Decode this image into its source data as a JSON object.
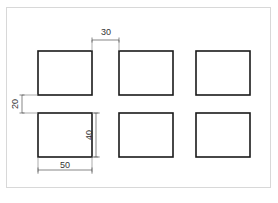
{
  "document": {
    "type": "engineering-drawing",
    "caption": ""
  },
  "frame": {
    "border_color": "#d8d8d8"
  },
  "style": {
    "line_color": "#1a1a1a",
    "dimension_line_color": "#555555",
    "extension_line_color": "#888888",
    "text_color": "#333333",
    "background": "#ffffff",
    "rect_stroke_width": 1.6,
    "dim_stroke_width": 0.7
  },
  "chart_data": {
    "type": "diagram",
    "title": "",
    "subtitle": "",
    "units": "mm",
    "grid": {
      "rows": 2,
      "columns": 3,
      "count": 6
    },
    "feature": {
      "shape": "rectangle",
      "width": 50,
      "height": 40
    },
    "spacing": {
      "column_gap": 30,
      "row_gap": 20,
      "column_pitch": 80,
      "row_pitch": 60
    },
    "rectangles": [
      {
        "id": "r1c1",
        "row": 1,
        "col": 1,
        "x": 38,
        "y": 51,
        "w": 54,
        "h": 44
      },
      {
        "id": "r1c2",
        "row": 1,
        "col": 2,
        "x": 119,
        "y": 51,
        "w": 54,
        "h": 44
      },
      {
        "id": "r1c3",
        "row": 1,
        "col": 3,
        "x": 196,
        "y": 51,
        "w": 54,
        "h": 44
      },
      {
        "id": "r2c1",
        "row": 2,
        "col": 1,
        "x": 38,
        "y": 113,
        "w": 54,
        "h": 44
      },
      {
        "id": "r2c2",
        "row": 2,
        "col": 2,
        "x": 119,
        "y": 113,
        "w": 54,
        "h": 44
      },
      {
        "id": "r2c3",
        "row": 2,
        "col": 3,
        "x": 196,
        "y": 113,
        "w": 54,
        "h": 44
      }
    ],
    "dimensions": [
      {
        "id": "dim-30",
        "label": "30",
        "value": 30,
        "orientation": "horizontal",
        "position": "top",
        "measures": "horizontal gap between column 1 and column 2",
        "line": {
          "x1": 92,
          "x2": 119,
          "y": 40
        },
        "extension": [
          {
            "x": 92,
            "y1": 40,
            "y2": 51
          },
          {
            "x": 119,
            "y1": 40,
            "y2": 51
          }
        ],
        "text_x": 106,
        "text_y": 33
      },
      {
        "id": "dim-20",
        "label": "20",
        "value": 20,
        "orientation": "vertical",
        "rotated": true,
        "position": "left",
        "measures": "vertical gap between row 1 and row 2",
        "line": {
          "x": 22,
          "y1": 95,
          "y2": 113
        },
        "extension": [
          {
            "y": 95,
            "x1": 22,
            "x2": 38
          },
          {
            "y": 113,
            "x1": 22,
            "x2": 38
          }
        ],
        "text_x": 16,
        "text_y": 104
      },
      {
        "id": "dim-40",
        "label": "40",
        "value": 40,
        "orientation": "vertical",
        "rotated": true,
        "position": "inner-right",
        "measures": "height of rectangle",
        "line": {
          "x": 96,
          "y1": 113,
          "y2": 157
        },
        "extension": [
          {
            "y": 113,
            "x1": 92,
            "x2": 100
          },
          {
            "y": 157,
            "x1": 92,
            "x2": 100
          }
        ],
        "text_x": 90,
        "text_y": 135
      },
      {
        "id": "dim-50",
        "label": "50",
        "value": 50,
        "orientation": "horizontal",
        "position": "bottom",
        "measures": "width of rectangle",
        "line": {
          "x1": 38,
          "x2": 92,
          "y": 170
        },
        "extension": [
          {
            "x": 38,
            "y1": 157,
            "y2": 174
          },
          {
            "x": 92,
            "y1": 157,
            "y2": 174
          }
        ],
        "text_x": 65,
        "text_y": 166
      }
    ]
  }
}
